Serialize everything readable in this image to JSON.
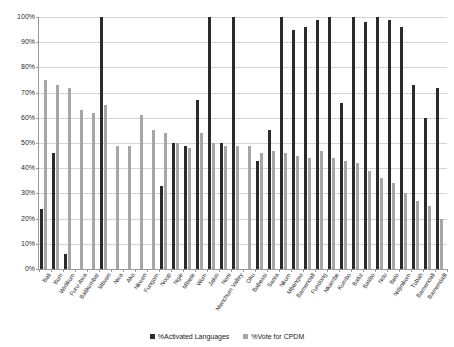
{
  "chart_data": {
    "type": "bar",
    "title": "",
    "xlabel": "",
    "ylabel": "",
    "ylim": [
      0,
      100
    ],
    "ytick_labels": [
      "0%",
      "10%",
      "20%",
      "30%",
      "40%",
      "50%",
      "60%",
      "70%",
      "80%",
      "90%",
      "100%"
    ],
    "ytick_values": [
      0,
      10,
      20,
      30,
      40,
      50,
      60,
      70,
      80,
      90,
      100
    ],
    "grid": true,
    "legend_position": "bottom",
    "categories": [
      "Bali",
      "Bum",
      "Widikum",
      "Furu-Awa",
      "Balikumbat",
      "Mbven",
      "Nwa",
      "Ako",
      "Nkwen",
      "Fungom",
      "Noop",
      "Ngie",
      "Mbiele",
      "Wum",
      "Jakiri",
      "Noni",
      "Menchum Valley",
      "Oku",
      "Babessi",
      "Santa",
      "Nkum",
      "Mbengwi",
      "Bamendall",
      "Fundong",
      "Nkambe",
      "Kumbo",
      "Bafut",
      "Batibo",
      "Ndu",
      "Belo",
      "Ndjinikom",
      "Tubah",
      "Bamendall",
      "Bamendalll"
    ],
    "series": [
      {
        "name": "%Activated Languages",
        "color": "#2b2b2b",
        "values": [
          24,
          46,
          6,
          0,
          0,
          100,
          0,
          0,
          0,
          0,
          33,
          50,
          49,
          67,
          100,
          50,
          100,
          0,
          43,
          55,
          100,
          95,
          96,
          99,
          100,
          66,
          100,
          98,
          100,
          99,
          96,
          73,
          60,
          72
        ]
      },
      {
        "name": "%Vote for CPDM",
        "color": "#a6a6a6",
        "values": [
          75,
          73,
          72,
          63,
          62,
          65,
          49,
          49,
          61,
          55,
          54,
          50,
          48,
          54,
          50,
          49,
          49,
          49,
          46,
          47,
          46,
          45,
          44,
          47,
          44,
          43,
          42,
          39,
          36,
          34,
          30,
          27,
          25,
          20
        ]
      }
    ]
  },
  "legend": {
    "items": [
      {
        "label": "%Activated Languages"
      },
      {
        "label": "%Vote for CPDM"
      }
    ]
  }
}
